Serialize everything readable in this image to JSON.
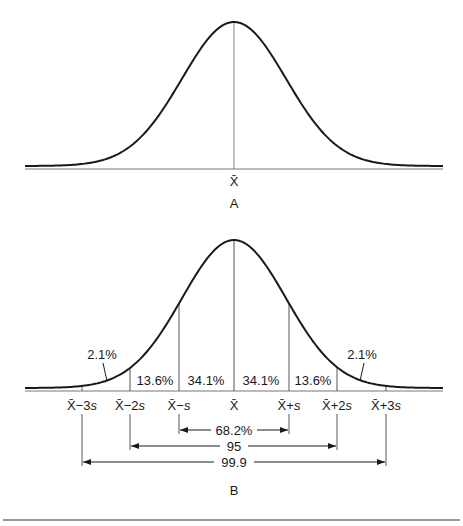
{
  "panel_a": {
    "label": "A",
    "mean_label": "X̄"
  },
  "panel_b": {
    "label": "B",
    "x_labels": [
      {
        "base": "X̄",
        "op": "−3",
        "s": "s"
      },
      {
        "base": "X̄",
        "op": "−2",
        "s": "s"
      },
      {
        "base": "X̄",
        "op": "−",
        "s": "s"
      },
      {
        "base": "X̄",
        "op": "",
        "s": ""
      },
      {
        "base": "X̄",
        "op": "+",
        "s": "s"
      },
      {
        "base": "X̄",
        "op": "+2",
        "s": "s"
      },
      {
        "base": "X̄",
        "op": "+3",
        "s": "s"
      }
    ],
    "region_percents": [
      "2.1%",
      "13.6%",
      "34.1%",
      "34.1%",
      "13.6%",
      "2.1%"
    ],
    "ranges": [
      {
        "label": "68.2%",
        "from": "X̄−s",
        "to": "X̄+s"
      },
      {
        "label": "95",
        "from": "X̄−2s",
        "to": "X̄+2s"
      },
      {
        "label": "99.9",
        "from": "X̄−3s",
        "to": "X̄+3s"
      }
    ]
  },
  "colors": {
    "curve": "#1a1a1a",
    "lines": "#555555",
    "text": "#1a1a1a"
  }
}
